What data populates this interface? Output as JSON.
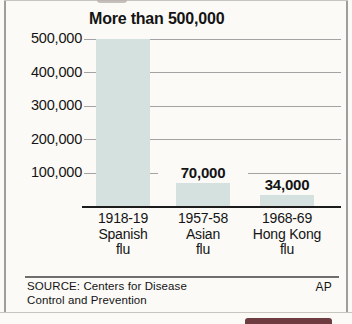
{
  "colors": {
    "bg": "#fbfaf7",
    "bar": "#d5e1df",
    "grid": "#a3a3a3",
    "axis": "#1c1c1c",
    "crop": "#6e3b40"
  },
  "chart_data": {
    "type": "bar",
    "title": "More than 500,000",
    "categories": [
      "1918-19\nSpanish\nflu",
      "1957-58\nAsian\nflu",
      "1968-69\nHong Kong\nflu"
    ],
    "values": [
      500000,
      70000,
      34000
    ],
    "bar_labels": [
      "More than 500,000",
      "70,000",
      "34,000"
    ],
    "y_ticks": [
      "500,000",
      "400,000",
      "300,000",
      "200,000",
      "100,000"
    ],
    "y_tick_values": [
      500000,
      400000,
      300000,
      200000,
      100000
    ],
    "ylim": [
      0,
      500000
    ],
    "xlabel": "",
    "ylabel": "",
    "grid": true,
    "legend": false,
    "note": "Spanish flu bar exceeds chart top; labeled 'More than 500,000'"
  },
  "footer": {
    "source_line1": "SOURCE: Centers for Disease",
    "source_line2": "Control and Prevention",
    "credit": "AP"
  }
}
